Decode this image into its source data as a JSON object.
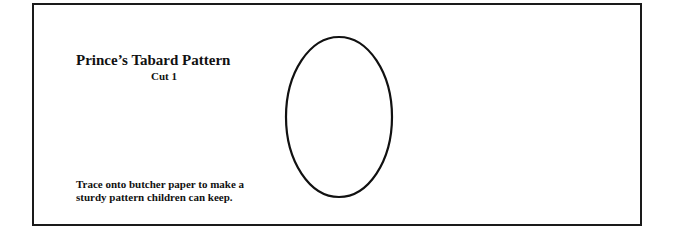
{
  "document": {
    "title": "Prince’s Tabard Pattern",
    "subtitle": "Cut 1",
    "instructions": {
      "line1": "Trace onto butcher paper to make a",
      "line2": "sturdy pattern children can keep."
    },
    "pattern_shape": "oval",
    "colors": {
      "ink": "#111111",
      "paper": "#ffffff"
    }
  }
}
